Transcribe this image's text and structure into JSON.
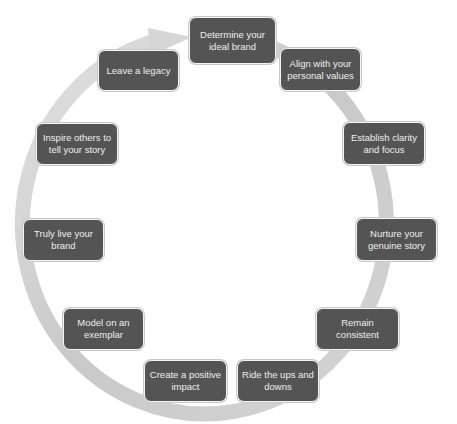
{
  "diagram": {
    "type": "cycle",
    "colors": {
      "box_fill": "#545454",
      "box_text": "#eeeeee",
      "ring": "#c8c8c8",
      "background": "#ffffff"
    },
    "steps": [
      {
        "label": "Determine your ideal brand"
      },
      {
        "label": "Align with your personal values"
      },
      {
        "label": "Establish clarity and focus"
      },
      {
        "label": "Nurture your genuine story"
      },
      {
        "label": "Remain consistent"
      },
      {
        "label": "Ride the ups and downs"
      },
      {
        "label": "Create a positive impact"
      },
      {
        "label": "Model on an exemplar"
      },
      {
        "label": "Truly live your brand"
      },
      {
        "label": "Inspire others to tell your story"
      },
      {
        "label": "Leave a legacy"
      }
    ]
  }
}
